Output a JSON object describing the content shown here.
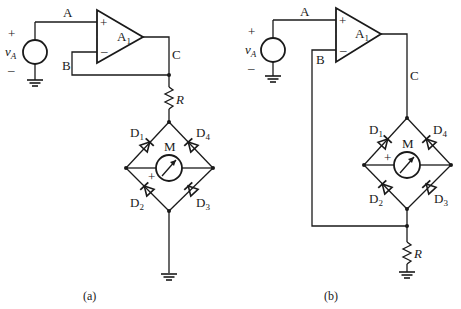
{
  "figure": {
    "panels": [
      {
        "id": "a",
        "caption": "(a)",
        "source": {
          "name": "v",
          "sub": "A",
          "plus": "+",
          "minus": "–"
        },
        "opamp": {
          "name": "A",
          "sub": "1",
          "plus_in": "+",
          "minus_in": "–"
        },
        "nodes": {
          "A": "A",
          "B": "B",
          "C": "C"
        },
        "resistor": {
          "name": "R",
          "position": "between op-amp output node and bridge top"
        },
        "bridge": {
          "meter": "M",
          "meter_polarity": "+",
          "diodes": [
            {
              "name": "D",
              "sub": "1"
            },
            {
              "name": "D",
              "sub": "4"
            },
            {
              "name": "D",
              "sub": "2"
            },
            {
              "name": "D",
              "sub": "3"
            }
          ]
        },
        "ground_label": ""
      },
      {
        "id": "b",
        "caption": "(b)",
        "source": {
          "name": "v",
          "sub": "A",
          "plus": "+",
          "minus": "–"
        },
        "opamp": {
          "name": "A",
          "sub": "1",
          "plus_in": "+",
          "minus_in": "–"
        },
        "nodes": {
          "A": "A",
          "B": "B",
          "C": "C"
        },
        "resistor": {
          "name": "R",
          "position": "between bridge bottom and ground, feedback taken from top of R"
        },
        "bridge": {
          "meter": "M",
          "meter_polarity": "+",
          "diodes": [
            {
              "name": "D",
              "sub": "1"
            },
            {
              "name": "D",
              "sub": "4"
            },
            {
              "name": "D",
              "sub": "2"
            },
            {
              "name": "D",
              "sub": "3"
            }
          ]
        }
      }
    ]
  }
}
